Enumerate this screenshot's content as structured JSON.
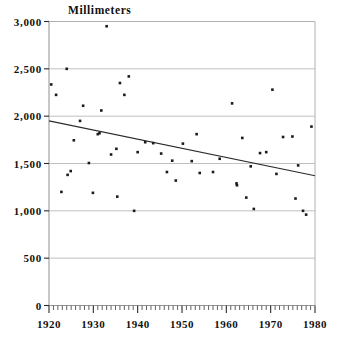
{
  "chart_data": {
    "type": "scatter",
    "title": "",
    "ylabel": "Millimeters",
    "xlabel": "",
    "xlim": [
      1920,
      1980
    ],
    "ylim": [
      0,
      3000
    ],
    "grid": true,
    "legend": null,
    "ytick_labels": [
      "0",
      "500",
      "1,000",
      "1,500",
      "2,000",
      "2,500",
      "3,000"
    ],
    "ytick_values": [
      0,
      500,
      1000,
      1500,
      2000,
      2500,
      3000
    ],
    "xtick_labels": [
      "1920",
      "1930",
      "1940",
      "1950",
      "1960",
      "1970",
      "1980"
    ],
    "xtick_values": [
      1920,
      1930,
      1940,
      1950,
      1960,
      1970,
      1980
    ],
    "minor_xtick_step": 1,
    "x": [
      1920.5,
      1921.6,
      1922.8,
      1924.0,
      1924.2,
      1924.9,
      1925.6,
      1927.0,
      1927.7,
      1929.0,
      1929.9,
      1931.0,
      1931.4,
      1931.8,
      1933.0,
      1934.0,
      1935.2,
      1935.4,
      1936.0,
      1937.0,
      1938.0,
      1939.2,
      1940.0,
      1941.7,
      1943.5,
      1945.3,
      1946.6,
      1947.8,
      1948.6,
      1950.2,
      1952.2,
      1953.3,
      1954.0,
      1957.0,
      1958.5,
      1961.3,
      1962.3,
      1962.4,
      1963.6,
      1964.5,
      1965.5,
      1966.2,
      1967.6,
      1969.0,
      1970.4,
      1971.3,
      1972.8,
      1974.9,
      1975.6,
      1976.2,
      1977.3,
      1978.0,
      1979.2
    ],
    "y": [
      2335,
      2225,
      1200,
      2500,
      1380,
      1420,
      1745,
      1950,
      2110,
      1505,
      1190,
      1810,
      1820,
      2060,
      2950,
      1595,
      1655,
      1150,
      2350,
      2225,
      2420,
      1000,
      1620,
      1725,
      1715,
      1605,
      1410,
      1530,
      1320,
      1710,
      1525,
      1810,
      1400,
      1410,
      1550,
      2135,
      1290,
      1270,
      1770,
      1140,
      1470,
      1020,
      1610,
      1620,
      2280,
      1390,
      1780,
      1785,
      1130,
      1480,
      1000,
      960,
      1890
    ],
    "trendline": {
      "type": "linear-fit",
      "x_start": 1920,
      "y_start": 1950,
      "x_end": 1980,
      "y_end": 1370
    }
  }
}
